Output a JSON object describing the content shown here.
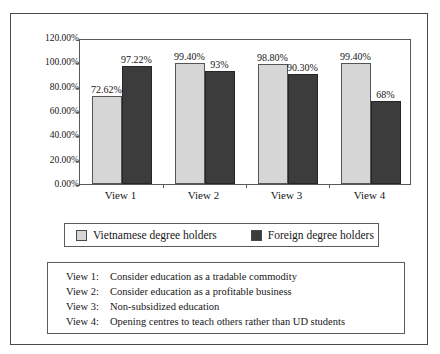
{
  "chart_data": {
    "type": "bar",
    "title": "",
    "subtitle": "",
    "xlabel": "",
    "ylabel": "",
    "grid": false,
    "legend_position": "bottom",
    "ylim": [
      0,
      120
    ],
    "ytick_labels": [
      "120.00%",
      "100.00%",
      "80.00%",
      "60.00%",
      "40.00%",
      "20.00%",
      "0.00%"
    ],
    "ytick_values": [
      120,
      100,
      80,
      60,
      40,
      20,
      0
    ],
    "categories": [
      "View 1",
      "View 2",
      "View 3",
      "View 4"
    ],
    "series": [
      {
        "name": "Vietnamese degree holders",
        "color": "#d6d6d6",
        "values": [
          72.62,
          99.4,
          98.8,
          99.4
        ],
        "data_labels": [
          "72.62%",
          "99.40%",
          "98.80%",
          "99.40%"
        ]
      },
      {
        "name": "Foreign degree holders",
        "color": "#3c3c3c",
        "values": [
          97.22,
          93.0,
          90.3,
          68.0
        ],
        "data_labels": [
          "97.22%",
          "93%",
          "90.30%",
          "68%"
        ]
      }
    ]
  },
  "legend": {
    "entries": [
      {
        "label": "Vietnamese degree holders",
        "swatch": "light"
      },
      {
        "label": "Foreign degree holders",
        "swatch": "dark"
      }
    ]
  },
  "views_box": {
    "rows": [
      {
        "key": "View 1:",
        "desc": "Consider education as a tradable commodity"
      },
      {
        "key": "View 2:",
        "desc": "Consider education as a profitable business"
      },
      {
        "key": "View 3:",
        "desc": "Non-subsidized education"
      },
      {
        "key": "View 4:",
        "desc": "Opening centres to teach others rather than UD students"
      }
    ]
  }
}
